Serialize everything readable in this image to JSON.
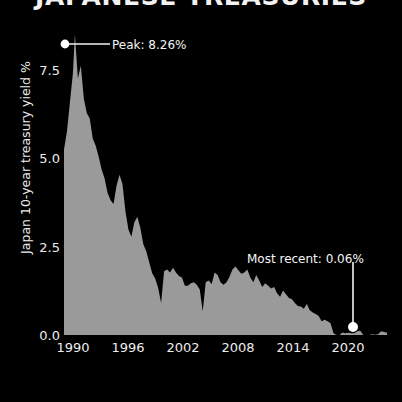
{
  "title": "JAPANESE TREASURIES",
  "theme": {
    "background": "#000000",
    "text": "#ffffff",
    "area_fill": "#9a9a9a",
    "annotation": "#f5f5f5"
  },
  "axes": {
    "ylabel": "Japan 10-year treasury yield %",
    "xlabel": "",
    "yticks": [
      "0.0",
      "2.5",
      "5.0",
      "7.5"
    ],
    "xticks": [
      "1990",
      "1996",
      "2002",
      "2008",
      "2014",
      "2020"
    ]
  },
  "annotations": {
    "peak": {
      "label": "Peak: 8.26%",
      "value": 8.26,
      "x_year": 1990.1
    },
    "recent": {
      "label": "Most recent: 0.06%",
      "value": 0.06,
      "x_year": 2021.6
    }
  },
  "chart_data": {
    "type": "area",
    "title": "JAPANESE TREASURIES",
    "xlabel": "",
    "ylabel": "Japan 10-year treasury yield %",
    "xlim": [
      1989.0,
      2022.3
    ],
    "ylim": [
      0.0,
      8.6
    ],
    "grid": false,
    "legend": null,
    "series": [
      {
        "name": "Japan 10-year treasury yield %",
        "x": [
          1989.0,
          1989.3,
          1989.6,
          1989.9,
          1990.1,
          1990.4,
          1990.7,
          1991.0,
          1991.3,
          1991.6,
          1991.9,
          1992.2,
          1992.5,
          1992.8,
          1993.1,
          1993.4,
          1993.7,
          1994.0,
          1994.3,
          1994.6,
          1994.9,
          1995.2,
          1995.5,
          1995.8,
          1996.1,
          1996.4,
          1996.7,
          1997.0,
          1997.3,
          1997.6,
          1997.9,
          1998.2,
          1998.5,
          1998.8,
          1999.1,
          1999.4,
          1999.7,
          2000.0,
          2000.3,
          2000.6,
          2000.9,
          2001.2,
          2001.5,
          2001.8,
          2002.1,
          2002.4,
          2002.7,
          2003.0,
          2003.3,
          2003.6,
          2003.9,
          2004.2,
          2004.5,
          2004.8,
          2005.1,
          2005.4,
          2005.7,
          2006.0,
          2006.3,
          2006.6,
          2006.9,
          2007.2,
          2007.5,
          2007.8,
          2008.1,
          2008.4,
          2008.7,
          2009.0,
          2009.3,
          2009.6,
          2009.9,
          2010.2,
          2010.5,
          2010.8,
          2011.1,
          2011.4,
          2011.7,
          2012.0,
          2012.3,
          2012.6,
          2012.9,
          2013.2,
          2013.5,
          2013.8,
          2014.1,
          2014.4,
          2014.7,
          2015.0,
          2015.3,
          2015.6,
          2015.9,
          2016.2,
          2016.5,
          2016.8,
          2017.1,
          2017.4,
          2017.7,
          2018.0,
          2018.3,
          2018.6,
          2018.9,
          2019.2,
          2019.5,
          2019.8,
          2020.1,
          2020.4,
          2020.7,
          2021.0,
          2021.3,
          2021.6
        ],
        "y": [
          5.1,
          5.6,
          6.4,
          7.2,
          8.26,
          7.05,
          7.4,
          6.5,
          6.1,
          5.95,
          5.4,
          5.2,
          4.9,
          4.55,
          4.3,
          3.9,
          3.7,
          3.6,
          4.1,
          4.4,
          4.15,
          3.4,
          2.9,
          2.7,
          3.1,
          3.25,
          2.95,
          2.5,
          2.3,
          2.0,
          1.7,
          1.55,
          1.3,
          0.88,
          1.75,
          1.8,
          1.72,
          1.85,
          1.72,
          1.62,
          1.58,
          1.35,
          1.35,
          1.42,
          1.45,
          1.38,
          1.25,
          0.65,
          1.45,
          1.5,
          1.4,
          1.72,
          1.65,
          1.45,
          1.38,
          1.45,
          1.6,
          1.8,
          1.88,
          1.78,
          1.68,
          1.72,
          1.8,
          1.58,
          1.45,
          1.65,
          1.5,
          1.32,
          1.42,
          1.35,
          1.28,
          1.32,
          1.15,
          1.05,
          1.22,
          1.12,
          1.02,
          0.98,
          0.88,
          0.8,
          0.78,
          0.72,
          0.85,
          0.68,
          0.62,
          0.58,
          0.52,
          0.38,
          0.42,
          0.38,
          0.32,
          0.05,
          -0.1,
          -0.05,
          0.07,
          0.05,
          0.06,
          0.05,
          0.05,
          0.1,
          0.12,
          -0.04,
          -0.16,
          -0.1,
          0.02,
          0.01,
          0.02,
          0.1,
          0.08,
          0.06
        ]
      }
    ]
  }
}
